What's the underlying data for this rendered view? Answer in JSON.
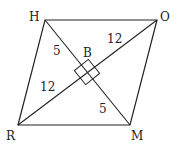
{
  "diagram": {
    "type": "rhombus",
    "vertices": [
      {
        "label": "H",
        "x": 45,
        "y": 20,
        "lx": 29,
        "ly": 21
      },
      {
        "label": "O",
        "x": 157,
        "y": 20,
        "lx": 160,
        "ly": 21
      },
      {
        "label": "M",
        "x": 130,
        "y": 125,
        "lx": 131,
        "ly": 140
      },
      {
        "label": "R",
        "x": 18,
        "y": 125,
        "lx": 6,
        "ly": 140
      }
    ],
    "center": {
      "label": "B",
      "x": 87,
      "y": 72,
      "lx": 83,
      "ly": 57
    },
    "segment_labels": [
      {
        "text": "5",
        "x": 53,
        "y": 55
      },
      {
        "text": "12",
        "x": 107,
        "y": 43
      },
      {
        "text": "12",
        "x": 40,
        "y": 91
      },
      {
        "text": "5",
        "x": 99,
        "y": 113
      }
    ],
    "right_angle_marker": true,
    "stroke_color": "#222222"
  }
}
